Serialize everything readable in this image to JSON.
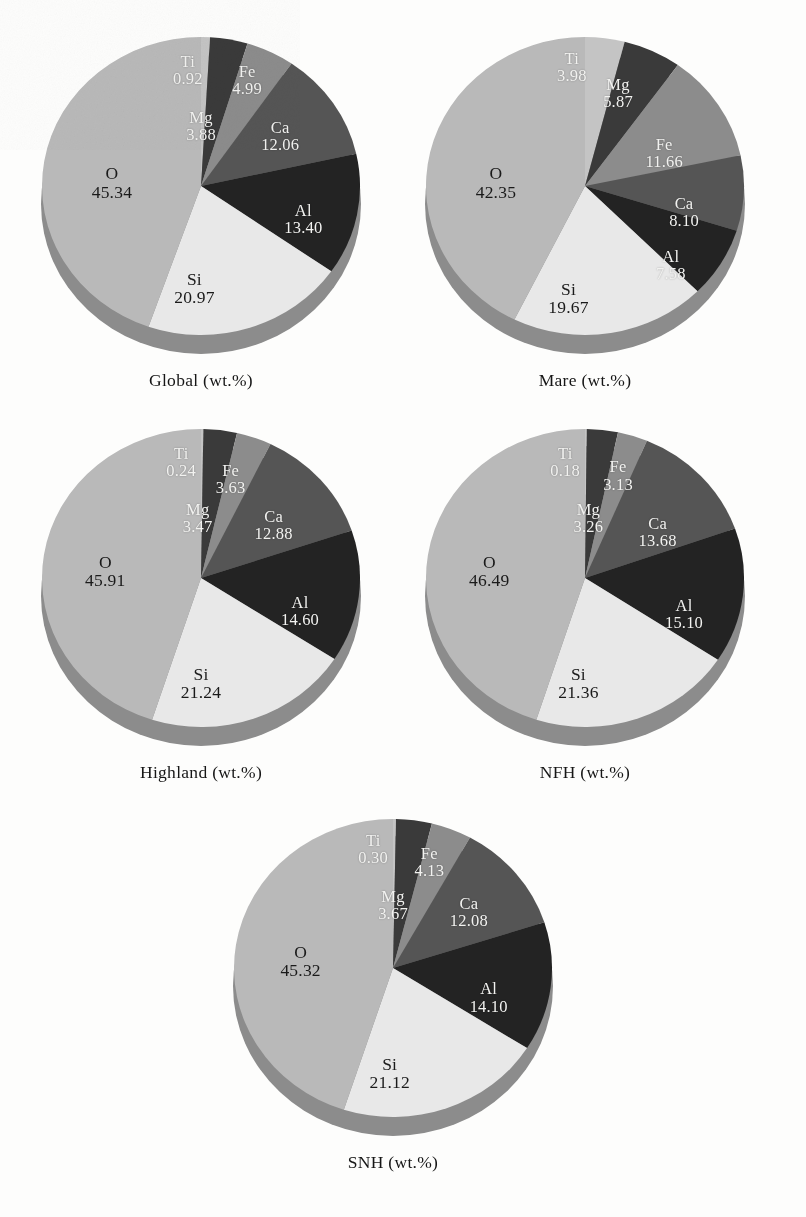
{
  "figure": {
    "kind": "five 3-D pie charts of lunar elemental abundances",
    "label_order_clockwise_from_top": [
      "Ti",
      "Mg",
      "Fe",
      "Ca",
      "Al",
      "Si",
      "O"
    ],
    "unit_suffix": "(wt.%)"
  },
  "colors": {
    "background": "#fdfdfc",
    "Ti": "#c4c4c4",
    "Mg": "#3a3a3a",
    "Fe": "#8c8c8c",
    "Ca": "#555555",
    "Al": "#232323",
    "Si": "#e8e8e8",
    "O": "#b9b9b9",
    "side_wall": "#8f8f8f",
    "label_light": "#f2f2f0",
    "label_dark": "#1a1a1a"
  },
  "chart_data": [
    {
      "type": "pie",
      "title": "Global (wt.%)",
      "categories": [
        "Ti",
        "Mg",
        "Fe",
        "Ca",
        "Al",
        "Si",
        "O"
      ],
      "values": [
        0.92,
        3.88,
        4.99,
        12.06,
        13.4,
        20.97,
        45.34
      ],
      "labels": [
        "0.92",
        "3.88",
        "4.99",
        "12.06",
        "13.40",
        "20.97",
        "45.34"
      ],
      "ylabel": "wt.%"
    },
    {
      "type": "pie",
      "title": "Mare (wt.%)",
      "categories": [
        "Ti",
        "Mg",
        "Fe",
        "Ca",
        "Al",
        "Si",
        "O"
      ],
      "values": [
        3.98,
        5.87,
        11.66,
        8.1,
        7.58,
        19.67,
        42.35
      ],
      "labels": [
        "3.98",
        "5.87",
        "11.66",
        "8.10",
        "7.58",
        "19.67",
        "42.35"
      ],
      "ylabel": "wt.%"
    },
    {
      "type": "pie",
      "title": "Highland (wt.%)",
      "categories": [
        "Ti",
        "Mg",
        "Fe",
        "Ca",
        "Al",
        "Si",
        "O"
      ],
      "values": [
        0.24,
        3.47,
        3.63,
        12.88,
        14.6,
        21.24,
        45.91
      ],
      "labels": [
        "0.24",
        "3.47",
        "3.63",
        "12.88",
        "14.60",
        "21.24",
        "45.91"
      ],
      "ylabel": "wt.%"
    },
    {
      "type": "pie",
      "title": "NFH (wt.%)",
      "categories": [
        "Ti",
        "Mg",
        "Fe",
        "Ca",
        "Al",
        "Si",
        "O"
      ],
      "values": [
        0.18,
        3.26,
        3.13,
        13.68,
        15.1,
        21.36,
        46.49
      ],
      "labels": [
        "0.18",
        "3.26",
        "3.13",
        "13.68",
        "15.10",
        "21.36",
        "46.49"
      ],
      "ylabel": "wt.%"
    },
    {
      "type": "pie",
      "title": "SNH (wt.%)",
      "categories": [
        "Ti",
        "Mg",
        "Fe",
        "Ca",
        "Al",
        "Si",
        "O"
      ],
      "values": [
        0.3,
        3.67,
        4.13,
        12.08,
        14.1,
        21.12,
        45.32
      ],
      "labels": [
        "0.30",
        "3.67",
        "4.13",
        "12.08",
        "14.10",
        "21.12",
        "45.32"
      ],
      "ylabel": "wt.%"
    }
  ]
}
